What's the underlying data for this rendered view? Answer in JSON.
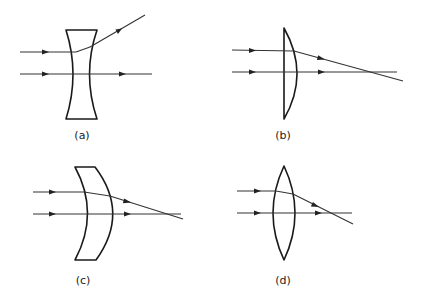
{
  "figure": {
    "panels": [
      {
        "id": "a",
        "label": "(a)",
        "lens_type": "biconcave (diverging)",
        "description": "Two parallel rays enter from left; upper ray diverges upward after lens, axial ray passes straight through."
      },
      {
        "id": "b",
        "label": "(b)",
        "lens_type": "plano-convex (converging)",
        "description": "Upper ray bends downward after lens and crosses the axial ray at focal point; axial ray passes straight."
      },
      {
        "id": "c",
        "label": "(c)",
        "lens_type": "convex meniscus (converging)",
        "description": "Upper ray bends downward through lens and crosses the axial ray; axial ray passes straight."
      },
      {
        "id": "d",
        "label": "(d)",
        "lens_type": "biconvex (converging)",
        "description": "Upper ray refracts downward and crosses the axial ray; axial ray passes straight."
      }
    ],
    "colors": {
      "stroke": "#1a1a1a",
      "ray": "#333333",
      "background": "#ffffff"
    }
  }
}
